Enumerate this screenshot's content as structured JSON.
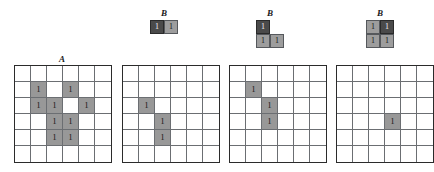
{
  "figure": {
    "type": "morphology-erosion-illustration",
    "grid_size": 6,
    "colors": {
      "origin_cell": "#4a4a4a",
      "filled_cell": "#989898",
      "grid_line": "#6b6e72",
      "grid_border": "#2b2b2b",
      "background": "#ffffff",
      "text": "#111111"
    },
    "cell_value_label": "1"
  },
  "structuring_elements": [
    {
      "label": "B",
      "name": "b-horizontal-pair",
      "rows": 1,
      "cols": 2,
      "cells": [
        [
          {
            "state": "origin",
            "value": "1"
          },
          {
            "state": "fill",
            "value": "1"
          }
        ]
      ]
    },
    {
      "label": "B",
      "name": "b-l-shape",
      "rows": 2,
      "cols": 2,
      "cells": [
        [
          {
            "state": "origin",
            "value": "1"
          },
          {
            "state": "empty",
            "value": ""
          }
        ],
        [
          {
            "state": "fill",
            "value": "1"
          },
          {
            "state": "fill",
            "value": "1"
          }
        ]
      ]
    },
    {
      "label": "B",
      "name": "b-square",
      "rows": 2,
      "cols": 2,
      "cells": [
        [
          {
            "state": "fill",
            "value": "1"
          },
          {
            "state": "origin",
            "value": "1"
          }
        ],
        [
          {
            "state": "fill",
            "value": "1"
          },
          {
            "state": "fill",
            "value": "1"
          }
        ]
      ]
    }
  ],
  "matrices": [
    {
      "label": "A",
      "name": "matrix-a-input",
      "values": [
        [
          "",
          "",
          "",
          "",
          "",
          ""
        ],
        [
          "",
          "1",
          "",
          "1",
          "",
          ""
        ],
        [
          "",
          "1",
          "1",
          "",
          "1",
          ""
        ],
        [
          "",
          "",
          "1",
          "1",
          "",
          ""
        ],
        [
          "",
          "",
          "1",
          "1",
          "",
          ""
        ],
        [
          "",
          "",
          "",
          "",
          "",
          ""
        ]
      ]
    },
    {
      "label": "",
      "name": "matrix-erosion-result-1",
      "values": [
        [
          "",
          "",
          "",
          "",
          "",
          ""
        ],
        [
          "",
          "",
          "",
          "",
          "",
          ""
        ],
        [
          "",
          "1",
          "",
          "",
          "",
          ""
        ],
        [
          "",
          "",
          "1",
          "",
          "",
          ""
        ],
        [
          "",
          "",
          "1",
          "",
          "",
          ""
        ],
        [
          "",
          "",
          "",
          "",
          "",
          ""
        ]
      ]
    },
    {
      "label": "",
      "name": "matrix-erosion-result-2",
      "values": [
        [
          "",
          "",
          "",
          "",
          "",
          ""
        ],
        [
          "",
          "1",
          "",
          "",
          "",
          ""
        ],
        [
          "",
          "",
          "1",
          "",
          "",
          ""
        ],
        [
          "",
          "",
          "1",
          "",
          "",
          ""
        ],
        [
          "",
          "",
          "",
          "",
          "",
          ""
        ],
        [
          "",
          "",
          "",
          "",
          "",
          ""
        ]
      ]
    },
    {
      "label": "",
      "name": "matrix-erosion-result-3",
      "values": [
        [
          "",
          "",
          "",
          "",
          "",
          ""
        ],
        [
          "",
          "",
          "",
          "",
          "",
          ""
        ],
        [
          "",
          "",
          "",
          "",
          "",
          ""
        ],
        [
          "",
          "",
          "",
          "1",
          "",
          ""
        ],
        [
          "",
          "",
          "",
          "",
          "",
          ""
        ],
        [
          "",
          "",
          "",
          "",
          "",
          ""
        ]
      ]
    }
  ]
}
